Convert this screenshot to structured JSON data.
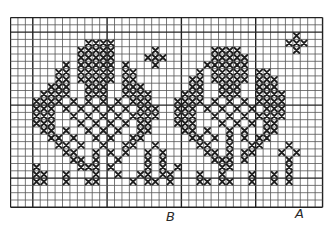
{
  "chart_title": "",
  "labels": {
    "b": "B",
    "a": "A"
  },
  "colors": {
    "grid_line": "#555555",
    "grid_major": "#222222",
    "stitch": "#1e1e1e",
    "background": "#ffffff"
  },
  "grid": {
    "cols": 42,
    "rows": 26,
    "cell_px": 7.43,
    "row_px": 7.3,
    "major_every": 10,
    "major_offset_col": 3,
    "major_offset_row": 2
  },
  "chart_data": {
    "type": "table",
    "legend": [
      {
        "symbol": "X",
        "meaning": "stitch"
      }
    ],
    "markers": [
      {
        "label": "B",
        "col": 21
      },
      {
        "label": "A",
        "col": 39
      }
    ],
    "pattern": [
      "..........................................",
      "..........................................",
      "......................................X...",
      "..........XXXX.......................XXX..",
      ".........XXXXX.....X.......XXXX.......X...",
      ".........XXXXX....XXX......XXXXX..........",
      ".......X.XXXXX.X...X......XXXXXX..........",
      "......XX.XXXXX.XX........X.XXXXX.XX.......",
      "......XX.XXXXX.XX.......XX.XXXXX.XXX......",
      ".....XXX..XXX..XXX......XX..XXX..XXX......",
      "....XXXX..XXX..XXXX....XXX..XXX..XXXX.....",
      "...XXXX.X.X.X.X.XXX...XXXX.X.X.X.XXXX.....",
      "...XXX.X.X.X.X.X.XXX..XXX.X.X.X.X.XXX.....",
      "...XXX..X.X.X.X.XXXX..XXX..X.X.X.XXXX.....",
      "...XXX...X.X.X.X.XX...XXX...X.X.X.XX......",
      "....XX.X..X.X.X..XX....XX.X..X.X..XX......",
      ".....XX.X..X.X..XX......XX.X.X.X.XX.......",
      "......XX.X..X..XX..X.....XX..X..XX...X....",
      ".......XX..X.X.X..X.X.....XX.X.XX...X.X...",
      "........XX.X..X...X.X......XXX.X.....X....",
      "...X.....XXX.X....X.X.X.....XX.......X....",
      "...XX..X...X..X..XX.XX...X..X...X..X.X....",
      "...XX..X..XX....X.XX.X...XX.XX..X..X.X....",
      "..........................................",
      "..........................................",
      ".........................................."
    ]
  }
}
